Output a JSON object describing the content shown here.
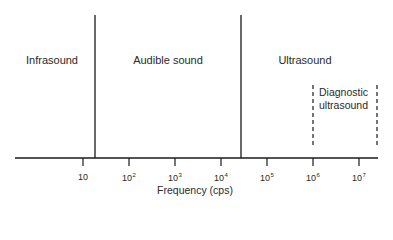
{
  "diagram": {
    "regions": [
      {
        "label": "Infrasound",
        "x": 52,
        "y": 54
      },
      {
        "label": "Audible sound",
        "x": 168,
        "y": 54
      },
      {
        "label": "Ultrasound",
        "x": 305,
        "y": 54
      }
    ],
    "subregion": {
      "line1": "Diagnostic",
      "line2": "ultrasound"
    },
    "axis": {
      "label": "Frequency (cps)",
      "ticks": [
        {
          "base": "10",
          "exp": "",
          "x": 83
        },
        {
          "base": "10",
          "exp": "2",
          "x": 129
        },
        {
          "base": "10",
          "exp": "3",
          "x": 175
        },
        {
          "base": "10",
          "exp": "4",
          "x": 221
        },
        {
          "base": "10",
          "exp": "5",
          "x": 267
        },
        {
          "base": "10",
          "exp": "6",
          "x": 313
        },
        {
          "base": "10",
          "exp": "7",
          "x": 359
        }
      ]
    },
    "boundaries": {
      "infrasound_audible": "~20 cps",
      "audible_ultrasound": "~20,000 cps",
      "diagnostic_range": "10^6 to ~2x10^7 cps"
    },
    "colors": {
      "line": "#1a1a1a",
      "text": "#2a2a2a",
      "background": "#ffffff"
    }
  }
}
